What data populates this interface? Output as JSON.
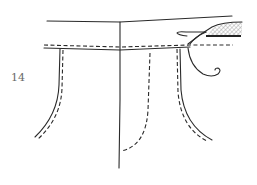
{
  "figure": {
    "label": "14",
    "colors": {
      "line": "#2a2a2a",
      "label": "#6a6a6a",
      "hatch": "#9a9a9a",
      "background": "#ffffff"
    },
    "legend": {
      "solid_line": "seam / edge",
      "dashed_line": "stitching line"
    }
  }
}
